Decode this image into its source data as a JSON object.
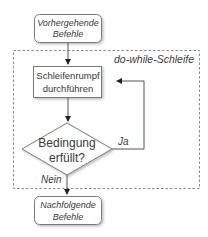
{
  "diagram": {
    "type": "flowchart",
    "title": "do-while-Schleife",
    "colors": {
      "stroke": "#7a7a7a",
      "text": "#3a3a3a",
      "dashed_frame": "#8a8a8a",
      "background": "#ffffff"
    },
    "nodes": {
      "start": {
        "shape": "rounded-rect",
        "line1": "Vorhergehende",
        "line2": "Befehle"
      },
      "body": {
        "shape": "rect",
        "line1": "Schleifenrumpf",
        "line2": "durchführen"
      },
      "condition": {
        "shape": "diamond",
        "line1": "Bedingung",
        "line2": "erfüllt?"
      },
      "end": {
        "shape": "rounded-rect",
        "line1": "Nachfolgende",
        "line2": "Befehle"
      }
    },
    "edges": [
      {
        "from": "start",
        "to": "body",
        "label": ""
      },
      {
        "from": "body",
        "to": "condition",
        "label": ""
      },
      {
        "from": "condition",
        "to": "body",
        "label": "Ja"
      },
      {
        "from": "condition",
        "to": "end",
        "label": "Nein"
      }
    ],
    "labels": {
      "frame": "do-while-Schleife",
      "yes": "Ja",
      "no": "Nein"
    }
  }
}
